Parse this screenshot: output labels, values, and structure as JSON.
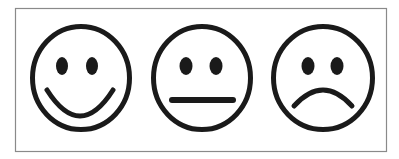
{
  "scale": {
    "title": "Satisfaction faces scale",
    "frame": {
      "x": 15,
      "y": 8,
      "width": 372,
      "height": 144,
      "stroke": "#8a8a8a",
      "fill": "#ffffff"
    },
    "ink_color": "#1a1a1a",
    "faces": [
      {
        "id": "happy",
        "label": "Happy face",
        "cx": 81,
        "cy": 78,
        "rx": 51,
        "ry": 54,
        "eyes": [
          {
            "cx": 62,
            "cy": 66,
            "rx": 6,
            "ry": 9
          },
          {
            "cx": 92,
            "cy": 66,
            "rx": 6,
            "ry": 9
          }
        ],
        "mouth": {
          "type": "smile",
          "path": "M 47 90 Q 80 142 113 90"
        }
      },
      {
        "id": "neutral",
        "label": "Neutral face",
        "cx": 202,
        "cy": 78,
        "rx": 51,
        "ry": 54,
        "eyes": [
          {
            "cx": 186,
            "cy": 66,
            "rx": 6.5,
            "ry": 9
          },
          {
            "cx": 216,
            "cy": 66,
            "rx": 6.5,
            "ry": 9
          }
        ],
        "mouth": {
          "type": "straight",
          "path": "M 172 100 L 233 100"
        }
      },
      {
        "id": "sad",
        "label": "Sad face",
        "cx": 323,
        "cy": 78,
        "rx": 52,
        "ry": 54,
        "eyes": [
          {
            "cx": 308,
            "cy": 66,
            "rx": 6.5,
            "ry": 9
          },
          {
            "cx": 337,
            "cy": 66,
            "rx": 6.5,
            "ry": 9
          }
        ],
        "mouth": {
          "type": "frown",
          "path": "M 294 106 Q 323 74 352 106"
        }
      }
    ]
  }
}
